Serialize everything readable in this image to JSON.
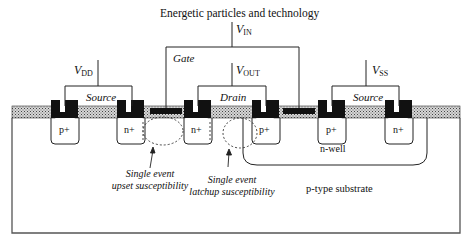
{
  "title": "Energetic particles and technology",
  "terminals": {
    "vin": {
      "base": "V",
      "sub": "IN"
    },
    "vdd": {
      "base": "V",
      "sub": "DD"
    },
    "vout": {
      "base": "V",
      "sub": "OUT"
    },
    "vss": {
      "base": "V",
      "sub": "SS"
    }
  },
  "regions": {
    "gate": "Gate",
    "source_left": "Source",
    "drain": "Drain",
    "source_right": "Source"
  },
  "diffusions": [
    "p+",
    "n+",
    "n+",
    "p+",
    "p+",
    "n+"
  ],
  "well": "n-well",
  "substrate": "p-type substrate",
  "annotations": {
    "seu": {
      "line1": "Single event",
      "line2": "upset susceptibility"
    },
    "sel": {
      "line1": "Single event",
      "line2": "latchup susceptibility"
    }
  },
  "colors": {
    "ink": "#111111",
    "oxide_fill": "#b8b8b8",
    "outline": "#555555"
  }
}
